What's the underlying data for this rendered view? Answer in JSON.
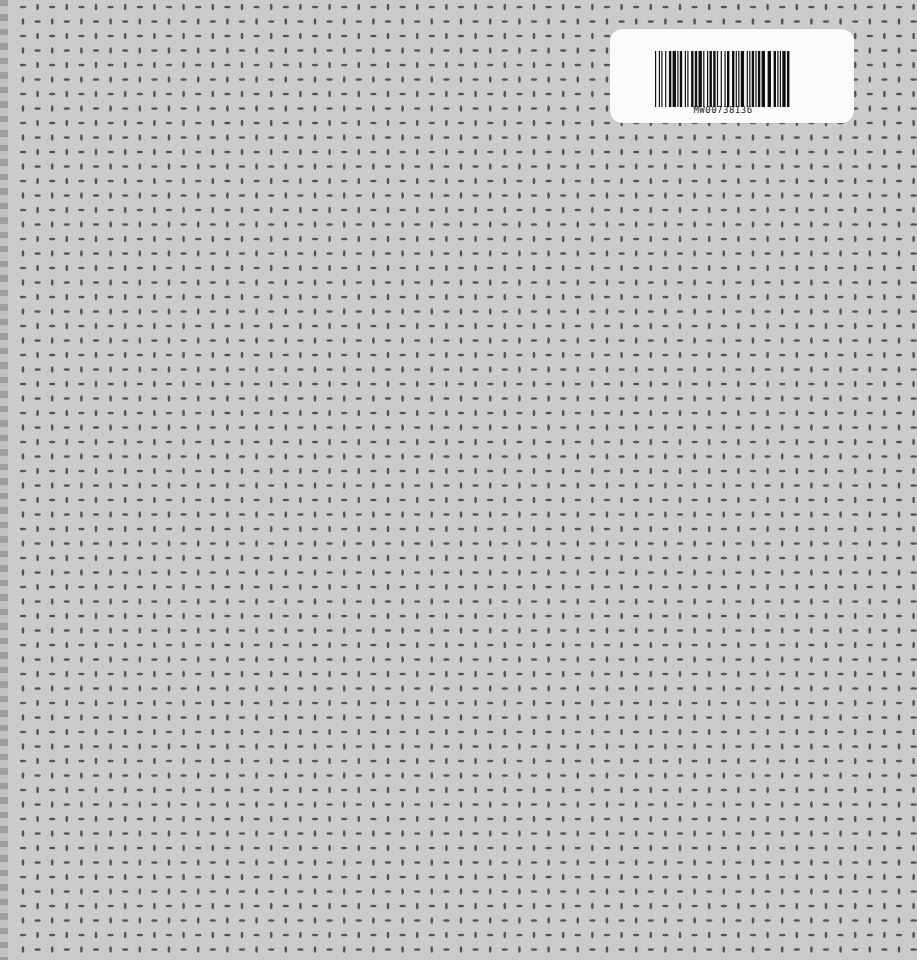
{
  "scene": {
    "description": "Notebook cover with dotted grid pattern and barcode sticker",
    "background_color": "#cbcbcb",
    "dot_color": "#555555",
    "grid": {
      "spacing_x": 14.6,
      "spacing_y": 14.5,
      "offset_x": 23,
      "offset_y": 7,
      "cols": 62,
      "rows": 67
    }
  },
  "sticker": {
    "barcode_text": "MW00738136",
    "color": "#fbfbfb"
  }
}
